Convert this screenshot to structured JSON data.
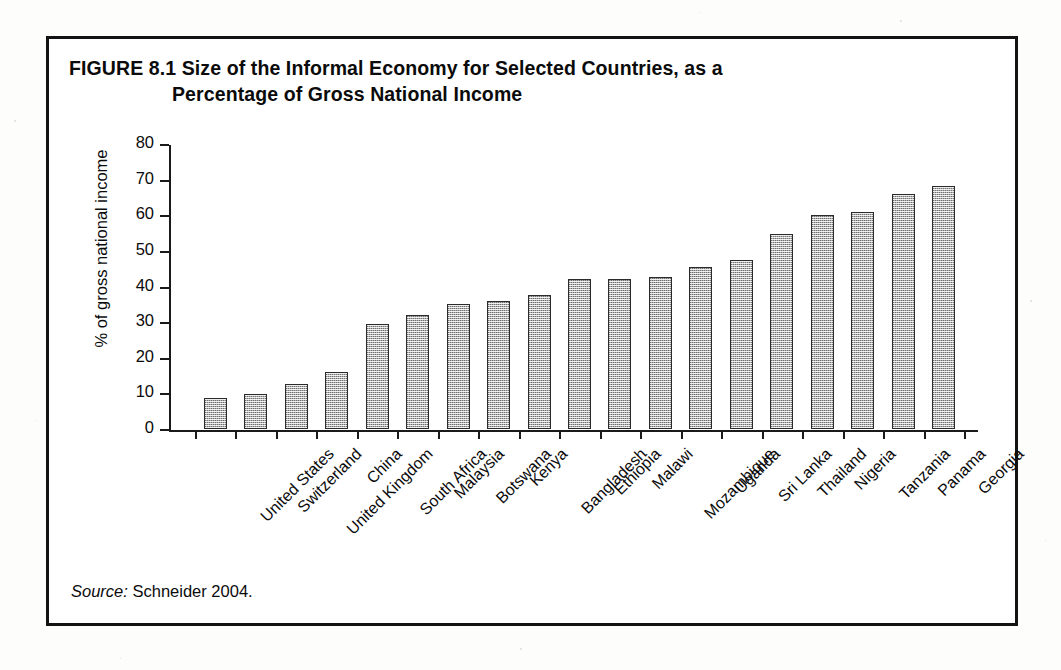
{
  "figure": {
    "number_label": "FIGURE 8.1",
    "title_line1": "Size of the Informal Economy for Selected Countries, as a",
    "title_line2": "Percentage of Gross National Income",
    "source_label": "Source:",
    "source_text": "Schneider 2004."
  },
  "colors": {
    "frame": "#131313",
    "axis": "#1a1a1a",
    "bar_fill": "#b0b0b0",
    "bar_border": "#2b2b2b",
    "text": "#0b0b0b",
    "page_background": "#ffffff"
  },
  "chart_data": {
    "type": "bar",
    "title": "FIGURE 8.1 Size of the Informal Economy for Selected Countries, as a Percentage of Gross National Income",
    "xlabel": "",
    "ylabel": "% of gross national income",
    "ylim": [
      0,
      80
    ],
    "yticks": [
      0,
      10,
      20,
      30,
      40,
      50,
      60,
      70,
      80
    ],
    "ytick_labels": [
      "0",
      "10",
      "20",
      "30",
      "40",
      "50",
      "60",
      "70",
      "80"
    ],
    "grid": false,
    "legend": false,
    "orientation": "vertical",
    "categories": [
      "United States",
      "Switzerland",
      "United Kingdom",
      "China",
      "South Africa",
      "Malaysia",
      "Botswana",
      "Kenya",
      "Bangladesh",
      "Ethiopia",
      "Malawi",
      "Mozambique",
      "Uganda",
      "Sri Lanka",
      "Thailand",
      "Nigeria",
      "Tanzania",
      "Panama",
      "Georgia"
    ],
    "values": [
      8.7,
      9.7,
      12.5,
      15.9,
      29.6,
      32.0,
      35.0,
      36.0,
      37.7,
      42.1,
      42.1,
      42.7,
      45.6,
      47.5,
      54.7,
      60.0,
      61.0,
      66.0,
      68.2
    ],
    "value_unit": "% of gross national income",
    "source": "Schneider 2004."
  }
}
